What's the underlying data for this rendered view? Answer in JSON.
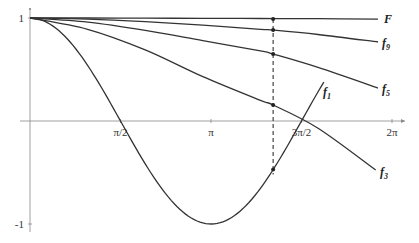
{
  "chart_data": {
    "type": "line",
    "title": "",
    "xlabel": "",
    "ylabel": "",
    "xlim": [
      0,
      6.4
    ],
    "ylim": [
      -1.05,
      1.05
    ],
    "grid": false,
    "x_ticks": [
      {
        "value": 1.5708,
        "label": "π/2"
      },
      {
        "value": 3.1416,
        "label": "π"
      },
      {
        "value": 4.7124,
        "label": "3π/2"
      },
      {
        "value": 6.2832,
        "label": "2π"
      }
    ],
    "y_ticks": [
      {
        "value": 1,
        "label": "1"
      },
      {
        "value": -1,
        "label": "-1"
      }
    ],
    "series": [
      {
        "name": "F",
        "label_main": "F",
        "label_sub": "",
        "x": [
          0,
          1,
          2,
          3,
          4,
          5,
          6.04
        ],
        "values": [
          1,
          1,
          0.998,
          0.997,
          0.995,
          0.993,
          0.99
        ]
      },
      {
        "name": "f9",
        "label_main": "f",
        "label_sub": "9",
        "x": [
          0,
          1,
          2,
          3,
          4,
          4.22,
          5,
          6.04
        ],
        "values": [
          1,
          0.99,
          0.965,
          0.93,
          0.89,
          0.883,
          0.84,
          0.767
        ]
      },
      {
        "name": "f5",
        "label_main": "f",
        "label_sub": "5",
        "x": [
          0,
          1,
          2,
          3,
          4,
          4.22,
          5,
          6.04
        ],
        "values": [
          1,
          0.96,
          0.88,
          0.78,
          0.68,
          0.65,
          0.52,
          0.32
        ]
      },
      {
        "name": "f3",
        "label_main": "f",
        "label_sub": "3",
        "x": [
          0,
          1,
          2,
          3,
          4,
          4.22,
          5,
          6.0
        ],
        "values": [
          1,
          0.89,
          0.69,
          0.43,
          0.2,
          0.155,
          -0.07,
          -0.476
        ]
      },
      {
        "name": "f1",
        "label_main": "f",
        "label_sub": "1",
        "function": "cos(x)",
        "x_range": [
          0,
          5.1
        ]
      }
    ],
    "annotations": [
      {
        "type": "dashed-vertical-line",
        "x": 4.22,
        "y_from": -0.52,
        "y_to": 0.99
      },
      {
        "type": "points",
        "x": 4.22,
        "values": [
          0.99,
          0.883,
          0.65,
          0.155,
          -0.47
        ]
      }
    ]
  }
}
